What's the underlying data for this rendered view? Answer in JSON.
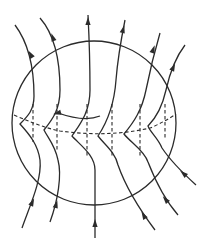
{
  "diagram": {
    "title": "",
    "colors": {
      "stroke": "#2b2b2b",
      "background": "#ffffff"
    },
    "circle": {
      "cx": 94,
      "cy": 123,
      "r": 82
    },
    "field_lines": [
      {
        "id": "line-1",
        "d": "M22,228 C30,205 42,180 40,160 C38,145 30,135 20,124 C28,116 34,110 34,96 C34,70 30,45 15,25"
      },
      {
        "id": "line-2",
        "d": "M50,222 C58,200 62,175 58,160 C55,145 48,138 44,130 C52,120 60,110 60,90 C60,60 55,35 40,18"
      },
      {
        "id": "line-3",
        "d": "M95,238 L95,170 C95,155 80,145 72,136 C80,124 90,112 90,90 C90,60 89,35 88,15"
      },
      {
        "id": "line-4",
        "d": "M155,230 C140,210 125,185 118,165 C115,152 105,145 98,136 C106,124 114,108 116,80 C118,55 122,35 125,20"
      },
      {
        "id": "line-5",
        "d": "M178,215 C165,200 155,180 148,162 C144,150 130,142 124,134 C134,122 142,110 146,90 C150,70 155,50 160,33"
      },
      {
        "id": "line-6",
        "d": "M196,185 C185,175 170,160 162,148 C158,138 150,132 148,126 C156,118 162,108 166,90 C170,72 175,58 185,45"
      }
    ],
    "arrows": [
      {
        "id": "arrow-top-1",
        "x": 31,
        "y": 55,
        "angle": -30
      },
      {
        "id": "arrow-top-2",
        "x": 53,
        "y": 38,
        "angle": -20
      },
      {
        "id": "arrow-top-3",
        "x": 88,
        "y": 22,
        "angle": 0
      },
      {
        "id": "arrow-top-4",
        "x": 123,
        "y": 30,
        "angle": 15
      },
      {
        "id": "arrow-top-5",
        "x": 153,
        "y": 50,
        "angle": 20
      },
      {
        "id": "arrow-top-6",
        "x": 173,
        "y": 68,
        "angle": 25
      },
      {
        "id": "arrow-bot-1",
        "x": 32,
        "y": 203,
        "angle": 25
      },
      {
        "id": "arrow-bot-2",
        "x": 56,
        "y": 205,
        "angle": 15
      },
      {
        "id": "arrow-bot-3",
        "x": 95,
        "y": 224,
        "angle": 0
      },
      {
        "id": "arrow-bot-4",
        "x": 144,
        "y": 216,
        "angle": -30
      },
      {
        "id": "arrow-bot-5",
        "x": 166,
        "y": 200,
        "angle": -40
      },
      {
        "id": "arrow-bot-6",
        "x": 184,
        "y": 174,
        "angle": -50
      }
    ],
    "center_arrow": {
      "d": "M100,116 C90,120 75,119 58,113",
      "head": {
        "x": 58,
        "y": 113,
        "angle": -105
      }
    },
    "dashed_front": "M14,115 C30,122 45,128 60,131 C90,135 120,135 150,128 C160,124 170,118 176,114",
    "dashed_verticals": [
      {
        "x": 33,
        "y1": 104,
        "y2": 142
      },
      {
        "x": 57,
        "y1": 104,
        "y2": 150
      },
      {
        "x": 87,
        "y1": 104,
        "y2": 157
      },
      {
        "x": 112,
        "y1": 104,
        "y2": 157
      },
      {
        "x": 140,
        "y1": 104,
        "y2": 157
      },
      {
        "x": 165,
        "y1": 104,
        "y2": 140
      }
    ]
  }
}
